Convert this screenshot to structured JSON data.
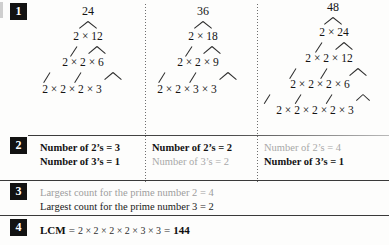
{
  "figure": {
    "title_hidden": "LCM by prime factor trees",
    "steps": [
      {
        "number": "1"
      },
      {
        "number": "2"
      },
      {
        "number": "3"
      },
      {
        "number": "4"
      }
    ]
  },
  "trees": [
    {
      "id": "tree-24",
      "root": "24",
      "levels": [
        [
          "24"
        ],
        [
          "2",
          "12"
        ],
        [
          "2",
          "2",
          "6"
        ],
        [
          "2",
          "2",
          "2",
          "3"
        ]
      ],
      "level_strings": [
        "24",
        "2 × 12",
        "2  ×  2  ×  6",
        "2  ×  2  ×  2 × 3"
      ]
    },
    {
      "id": "tree-36",
      "root": "36",
      "levels": [
        [
          "36"
        ],
        [
          "2",
          "18"
        ],
        [
          "2",
          "2",
          "9"
        ],
        [
          "2",
          "2",
          "3",
          "3"
        ]
      ],
      "level_strings": [
        "36",
        "2 × 18",
        "2  ×  2  ×  9",
        "2  ×  2  ×  3 × 3"
      ]
    },
    {
      "id": "tree-48",
      "root": "48",
      "levels": [
        [
          "48"
        ],
        [
          "2",
          "24"
        ],
        [
          "2",
          "2",
          "12"
        ],
        [
          "2",
          "2",
          "2",
          "6"
        ],
        [
          "2",
          "2",
          "2",
          "2",
          "3"
        ]
      ],
      "level_strings": [
        "48",
        "2 × 24",
        "2  ×  2  ×  12",
        "2  ×  2  ×  2 × 6",
        "2  ×  2  ×  2  ×  2 × 3"
      ]
    }
  ],
  "counts": [
    {
      "column": "24",
      "twos": "Number of 2’s = 3",
      "threes": "Number of 3’s = 1",
      "twos_highlight": "dark",
      "threes_highlight": "dark"
    },
    {
      "column": "36",
      "twos": "Number of 2’s = 2",
      "threes": "Number of 3’s = 2",
      "twos_highlight": "dark",
      "threes_highlight": "gray"
    },
    {
      "column": "48",
      "twos": "Number of 2’s = 4",
      "threes": "Number of 3’s = 1",
      "twos_highlight": "gray",
      "threes_highlight": "dark"
    }
  ],
  "largest": {
    "line1": "Largest count for the prime number 2 = 4",
    "line2": "Largest count for the prime number 3 = 2",
    "line1_highlight": "gray",
    "line2_highlight": "dark"
  },
  "result": {
    "label": "LCM",
    "equals": "=",
    "expression": "2 × 2 × 2 × 2 × 3 × 3",
    "equals2": "=",
    "value": "144"
  },
  "colors": {
    "badge_bg": "#121212",
    "badge_text": "#ffffff",
    "ink": "#141414",
    "muted": "#a8a8a8",
    "rule": "#3a3a3a",
    "page": "#fdfdfc"
  }
}
